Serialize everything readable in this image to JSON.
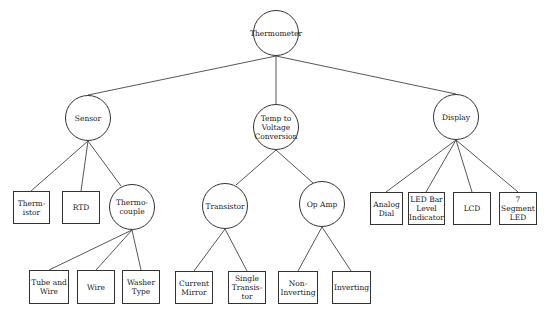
{
  "diagram": {
    "type": "tree",
    "root": "Thermometer",
    "nodes": [
      {
        "id": "thermometer",
        "label": "Thermometer",
        "shape": "circle",
        "cx": 276,
        "cy": 33,
        "r": 23
      },
      {
        "id": "sensor",
        "label": "Sensor",
        "shape": "circle",
        "cx": 88,
        "cy": 118,
        "r": 23
      },
      {
        "id": "temp",
        "label": "Temp to\nVoltage\nConversion",
        "shape": "circle",
        "cx": 276,
        "cy": 127,
        "r": 23
      },
      {
        "id": "display",
        "label": "Display",
        "shape": "circle",
        "cx": 456,
        "cy": 117,
        "r": 23
      },
      {
        "id": "thermistor",
        "label": "Thermo-\nistor",
        "display": "Therm-\nistor",
        "shape": "box",
        "x": 13,
        "y": 191,
        "w": 37,
        "h": 33
      },
      {
        "id": "rtd",
        "label": "RTD",
        "shape": "box",
        "x": 62,
        "y": 191,
        "w": 38,
        "h": 33
      },
      {
        "id": "thermocouple",
        "label": "Thermo-\ncouple",
        "shape": "circle",
        "cx": 132,
        "cy": 207,
        "r": 23
      },
      {
        "id": "tube_wire",
        "label": "Tube and\nWire",
        "shape": "box",
        "x": 29,
        "y": 270,
        "w": 40,
        "h": 34
      },
      {
        "id": "wire",
        "label": "Wire",
        "shape": "box",
        "x": 77,
        "y": 270,
        "w": 38,
        "h": 34
      },
      {
        "id": "washer",
        "label": "Washer\nType",
        "shape": "box",
        "x": 122,
        "y": 270,
        "w": 38,
        "h": 34
      },
      {
        "id": "transistor",
        "label": "Transistor",
        "shape": "circle",
        "cx": 225,
        "cy": 206,
        "r": 23
      },
      {
        "id": "opamp",
        "label": "Op Amp",
        "shape": "circle",
        "cx": 322,
        "cy": 204,
        "r": 23
      },
      {
        "id": "current_mirror",
        "label": "Current\nMirror",
        "shape": "box",
        "x": 175,
        "y": 271,
        "w": 38,
        "h": 33
      },
      {
        "id": "single_transistor",
        "label": "Single\nTransis-\ntor",
        "shape": "box",
        "x": 228,
        "y": 271,
        "w": 38,
        "h": 33
      },
      {
        "id": "non_inverting",
        "label": "Non-\nInverting",
        "shape": "box",
        "x": 278,
        "y": 271,
        "w": 40,
        "h": 33
      },
      {
        "id": "inverting",
        "label": "Inverting",
        "shape": "box",
        "x": 332,
        "y": 271,
        "w": 39,
        "h": 33
      },
      {
        "id": "analog_dial",
        "label": "Analog\nDial",
        "shape": "box",
        "x": 370,
        "y": 192,
        "w": 33,
        "h": 33
      },
      {
        "id": "led_bar",
        "label": "LED Bar\nLevel\nIndicator",
        "shape": "box",
        "x": 408,
        "y": 192,
        "w": 37,
        "h": 33
      },
      {
        "id": "lcd",
        "label": "LCD",
        "shape": "box",
        "x": 453,
        "y": 192,
        "w": 38,
        "h": 33
      },
      {
        "id": "seven_seg",
        "label": "7 Segment\nLED",
        "shape": "box",
        "x": 499,
        "y": 192,
        "w": 38,
        "h": 33
      }
    ],
    "edges": [
      [
        "thermometer",
        "sensor"
      ],
      [
        "thermometer",
        "temp"
      ],
      [
        "thermometer",
        "display"
      ],
      [
        "sensor",
        "thermistor"
      ],
      [
        "sensor",
        "rtd"
      ],
      [
        "sensor",
        "thermocouple"
      ],
      [
        "thermocouple",
        "tube_wire"
      ],
      [
        "thermocouple",
        "wire"
      ],
      [
        "thermocouple",
        "washer"
      ],
      [
        "temp",
        "transistor"
      ],
      [
        "temp",
        "opamp"
      ],
      [
        "transistor",
        "current_mirror"
      ],
      [
        "transistor",
        "single_transistor"
      ],
      [
        "opamp",
        "non_inverting"
      ],
      [
        "opamp",
        "inverting"
      ],
      [
        "display",
        "analog_dial"
      ],
      [
        "display",
        "led_bar"
      ],
      [
        "display",
        "lcd"
      ],
      [
        "display",
        "seven_seg"
      ]
    ]
  },
  "labels": {
    "thermometer": "Thermometer",
    "sensor": "Sensor",
    "temp": "Temp to\nVoltage\nConversion",
    "display": "Display",
    "thermistor": "Therm-\nistor",
    "rtd": "RTD",
    "thermocouple": "Thermo-\ncouple",
    "tube_wire": "Tube and\nWire",
    "wire": "Wire",
    "washer": "Washer\nType",
    "transistor": "Transistor",
    "opamp": "Op Amp",
    "current_mirror": "Current\nMirror",
    "single_transistor": "Single\nTransis-\ntor",
    "non_inverting": "Non-\nInverting",
    "inverting": "Inverting",
    "analog_dial": "Analog\nDial",
    "led_bar": "LED Bar\nLevel\nIndicator",
    "lcd": "LCD",
    "seven_seg": "7 Segment\nLED"
  }
}
